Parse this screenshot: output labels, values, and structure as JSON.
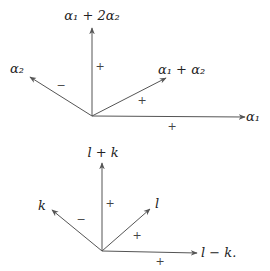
{
  "diagrams": [
    {
      "name": "root-system-top",
      "origin": [
        92,
        116
      ],
      "vectors": [
        {
          "id": "a1p2a2",
          "label": "α₁ + 2α₂",
          "tip": [
            92,
            28
          ],
          "label_pos": [
            92,
            20
          ],
          "anchor": "middle",
          "sign": "+",
          "sign_pos": [
            100,
            70
          ]
        },
        {
          "id": "a2",
          "label": "α₂",
          "tip": [
            30,
            77
          ],
          "label_pos": [
            10,
            73
          ],
          "anchor": "start",
          "sign": "−",
          "sign_pos": [
            61,
            89
          ]
        },
        {
          "id": "a1pa2",
          "label": "α₁ + α₂",
          "tip": [
            166,
            78
          ],
          "label_pos": [
            158,
            74
          ],
          "anchor": "start",
          "sign": "+",
          "sign_pos": [
            142,
            104
          ]
        },
        {
          "id": "a1",
          "label": "α₁",
          "tip": [
            245,
            117
          ],
          "label_pos": [
            246,
            121
          ],
          "anchor": "start",
          "sign": "+",
          "sign_pos": [
            172,
            130
          ]
        }
      ]
    },
    {
      "name": "root-system-bottom",
      "origin": [
        102,
        251
      ],
      "vectors": [
        {
          "id": "lpk",
          "label": "l + k",
          "tip": [
            102,
            163
          ],
          "label_pos": [
            103,
            157
          ],
          "anchor": "middle",
          "sign": "+",
          "sign_pos": [
            110,
            207
          ]
        },
        {
          "id": "k",
          "label": "k",
          "tip": [
            52,
            210
          ],
          "label_pos": [
            38,
            210
          ],
          "anchor": "start",
          "sign": "−",
          "sign_pos": [
            81,
            223
          ]
        },
        {
          "id": "l",
          "label": "l",
          "tip": [
            150,
            209
          ],
          "label_pos": [
            155,
            208
          ],
          "anchor": "start",
          "sign": "+",
          "sign_pos": [
            137,
            239
          ]
        },
        {
          "id": "lmk",
          "label": "l − k.",
          "tip": [
            197,
            253
          ],
          "label_pos": [
            201,
            257
          ],
          "anchor": "start",
          "sign": "+",
          "sign_pos": [
            160,
            265
          ]
        }
      ]
    }
  ],
  "colors": {
    "stroke": "#555555",
    "text": "#222222",
    "background": "#ffffff"
  }
}
